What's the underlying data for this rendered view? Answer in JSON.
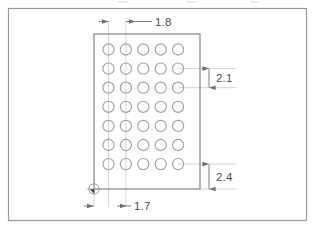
{
  "drawing": {
    "title": "Pad array layout drawing",
    "sheet": {
      "width": 315,
      "height": 230,
      "background_color": "#ffffff",
      "border_color": "#9a9a9a"
    },
    "colors": {
      "outline": "#8d8d8d",
      "pad_outline": "#a0a0a0",
      "dimension_line": "#808080",
      "center_line": "#b8b8b8",
      "text": "#4a4a4a",
      "datum_fill": "#3a3a3a"
    },
    "body_outline": {
      "name": "component-outline",
      "shape": "rectangle",
      "x": 94,
      "y": 34,
      "width": 106,
      "height": 155
    },
    "pad_array": {
      "name": "pad-grid",
      "columns": 5,
      "rows": 7,
      "total_pads": 35,
      "pad_diameter": 11.2,
      "column_pitch_px": 17.4,
      "row_pitch_px": 19.1,
      "first_pad_center_x": 108.5,
      "first_pad_center_y": 49.5
    },
    "dimensions": [
      {
        "id": "column-pitch",
        "value": "1.8",
        "orientation": "horizontal",
        "describes": "pitch between pad column 1 and pad column 2",
        "label_x": 163,
        "label_y": 26
      },
      {
        "id": "row-pitch",
        "value": "2.1",
        "orientation": "vertical",
        "describes": "pitch between pad row 2 and pad row 3",
        "label_x": 213,
        "label_y": 87
      },
      {
        "id": "bottom-offset",
        "value": "2.4",
        "orientation": "vertical",
        "describes": "offset from bottom pad row to bottom body edge",
        "label_x": 213,
        "label_y": 189
      },
      {
        "id": "left-offset",
        "value": "1.7",
        "orientation": "horizontal",
        "describes": "offset from left body edge to first pad column",
        "label_x": 141,
        "label_y": 213
      }
    ],
    "datum": {
      "id": "datum-origin",
      "name": "origin marker at lower-left body corner",
      "x": 94,
      "y": 189,
      "marker_radius": 5.2
    }
  }
}
